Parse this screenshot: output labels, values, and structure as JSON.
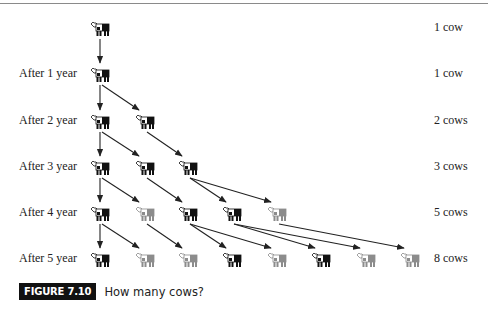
{
  "figure": {
    "badge": "FIGURE 7.10",
    "caption": "How many cows?"
  },
  "rows": [
    {
      "label": "",
      "count": "1 cow",
      "y": 28
    },
    {
      "label": "After 1 year",
      "count": "1 cow",
      "y": 74
    },
    {
      "label": "After 2 year",
      "count": "2 cows",
      "y": 121
    },
    {
      "label": "After 3 year",
      "count": "3 cows",
      "y": 167
    },
    {
      "label": "After 4 year",
      "count": "5 cows",
      "y": 213
    },
    {
      "label": "After 5 year",
      "count": "8 cows",
      "y": 259
    }
  ],
  "columns_x": [
    100,
    145,
    188,
    232,
    277,
    321,
    366,
    410
  ],
  "cows": [
    {
      "row": 0,
      "col": 0,
      "shade": "dark"
    },
    {
      "row": 1,
      "col": 0,
      "shade": "dark"
    },
    {
      "row": 2,
      "col": 0,
      "shade": "dark"
    },
    {
      "row": 2,
      "col": 1,
      "shade": "dark"
    },
    {
      "row": 3,
      "col": 0,
      "shade": "dark"
    },
    {
      "row": 3,
      "col": 1,
      "shade": "dark"
    },
    {
      "row": 3,
      "col": 2,
      "shade": "dark"
    },
    {
      "row": 4,
      "col": 0,
      "shade": "dark"
    },
    {
      "row": 4,
      "col": 1,
      "shade": "light"
    },
    {
      "row": 4,
      "col": 2,
      "shade": "dark"
    },
    {
      "row": 4,
      "col": 3,
      "shade": "dark"
    },
    {
      "row": 4,
      "col": 4,
      "shade": "light"
    },
    {
      "row": 5,
      "col": 0,
      "shade": "dark"
    },
    {
      "row": 5,
      "col": 1,
      "shade": "light"
    },
    {
      "row": 5,
      "col": 2,
      "shade": "light"
    },
    {
      "row": 5,
      "col": 3,
      "shade": "dark"
    },
    {
      "row": 5,
      "col": 4,
      "shade": "light"
    },
    {
      "row": 5,
      "col": 5,
      "shade": "dark"
    },
    {
      "row": 5,
      "col": 6,
      "shade": "light"
    },
    {
      "row": 5,
      "col": 7,
      "shade": "light"
    }
  ],
  "arrows": [
    {
      "from": [
        0,
        0
      ],
      "to": [
        1,
        0
      ]
    },
    {
      "from": [
        1,
        0
      ],
      "to": [
        2,
        0
      ]
    },
    {
      "from": [
        1,
        0
      ],
      "to": [
        2,
        1
      ]
    },
    {
      "from": [
        2,
        0
      ],
      "to": [
        3,
        0
      ]
    },
    {
      "from": [
        2,
        0
      ],
      "to": [
        3,
        1
      ]
    },
    {
      "from": [
        2,
        1
      ],
      "to": [
        3,
        2
      ]
    },
    {
      "from": [
        3,
        0
      ],
      "to": [
        4,
        0
      ]
    },
    {
      "from": [
        3,
        0
      ],
      "to": [
        4,
        1
      ]
    },
    {
      "from": [
        3,
        1
      ],
      "to": [
        4,
        2
      ]
    },
    {
      "from": [
        3,
        2
      ],
      "to": [
        4,
        3
      ]
    },
    {
      "from": [
        3,
        2
      ],
      "to": [
        4,
        4
      ]
    },
    {
      "from": [
        4,
        0
      ],
      "to": [
        5,
        0
      ]
    },
    {
      "from": [
        4,
        0
      ],
      "to": [
        5,
        1
      ]
    },
    {
      "from": [
        4,
        1
      ],
      "to": [
        5,
        2
      ]
    },
    {
      "from": [
        4,
        2
      ],
      "to": [
        5,
        3
      ]
    },
    {
      "from": [
        4,
        2
      ],
      "to": [
        5,
        4
      ]
    },
    {
      "from": [
        4,
        3
      ],
      "to": [
        5,
        5
      ]
    },
    {
      "from": [
        4,
        3
      ],
      "to": [
        5,
        6
      ]
    },
    {
      "from": [
        4,
        4
      ],
      "to": [
        5,
        7
      ]
    }
  ],
  "colors": {
    "dark_cow": "#111111",
    "light_cow": "#8c8c8c",
    "arrow": "#222222"
  }
}
